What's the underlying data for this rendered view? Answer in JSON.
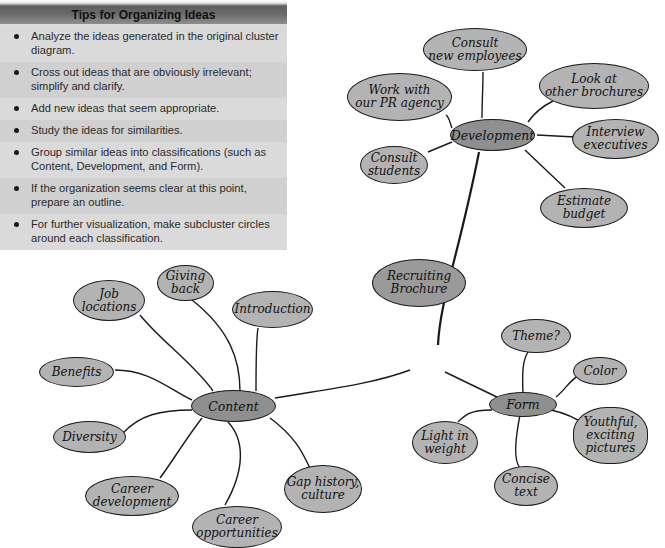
{
  "tips": {
    "title": "Tips for Organizing Ideas",
    "items": [
      "Analyze the ideas generated in the original cluster diagram.",
      "Cross out ideas that are obviously irrelevant; simplify and clarify.",
      "Add new ideas that seem appropriate.",
      "Study the ideas for similarities.",
      "Group similar ideas into classifications (such as Content, Development, and Form).",
      "If the organization seems clear at this point, prepare an outline.",
      "For further visualization, make subcluster circles around each classification."
    ]
  },
  "diagram": {
    "root": {
      "label": "Recruiting\nBrochure"
    },
    "development": {
      "label": "Development",
      "children": [
        "Consult\nnew employees",
        "Work with\nour PR agency",
        "Look at\nother brochures",
        "Interview\nexecutives",
        "Consult\nstudents",
        "Estimate\nbudget"
      ]
    },
    "content": {
      "label": "Content",
      "children": [
        "Job\nlocations",
        "Giving\nback",
        "Introduction",
        "Benefits",
        "Diversity",
        "Career\ndevelopment",
        "Career\nopportunities",
        "Gap history,\nculture"
      ]
    },
    "form": {
      "label": "Form",
      "children": [
        "Theme?",
        "Color",
        "Youthful,\nexciting\npictures",
        "Light in\nweight",
        "Concise\ntext"
      ]
    }
  }
}
